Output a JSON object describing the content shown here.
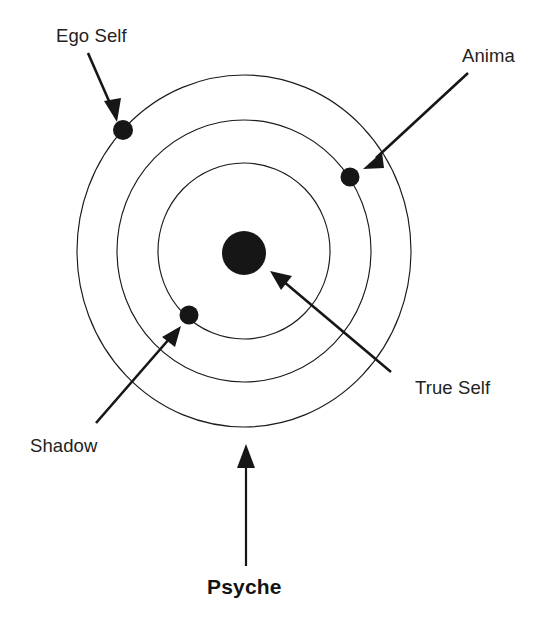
{
  "diagram": {
    "title": "Psyche",
    "type": "concentric-circles",
    "background_color": "#ffffff",
    "line_color": "#161616",
    "ring_color": "#1b1b1b",
    "center": {
      "x": 244,
      "y": 251
    },
    "rings": [
      {
        "name": "inner-ring",
        "radius_x": 86,
        "radius_y": 88
      },
      {
        "name": "middle-ring",
        "radius_x": 127,
        "radius_y": 131
      },
      {
        "name": "outer-ring",
        "radius_x": 167,
        "radius_y": 176
      }
    ],
    "nodes": [
      {
        "id": "true-self",
        "label": "True Self",
        "x": 244,
        "y": 253,
        "radius": 22,
        "ring": "center",
        "label_x": 415,
        "label_y": 379
      },
      {
        "id": "ego-self",
        "label": "Ego Self",
        "x": 123,
        "y": 130,
        "radius": 10,
        "ring": "outer-ring",
        "label_x": 56,
        "label_y": 27
      },
      {
        "id": "anima",
        "label": "Anima",
        "x": 350,
        "y": 177,
        "radius": 9.5,
        "ring": "middle-ring",
        "label_x": 462,
        "label_y": 47
      },
      {
        "id": "shadow",
        "label": "Shadow",
        "x": 189,
        "y": 315,
        "radius": 9.5,
        "ring": "inner-ring",
        "label_x": 30,
        "label_y": 437
      }
    ],
    "caption": {
      "text": "Psyche",
      "bold": true,
      "x": 207,
      "y": 576
    },
    "arrows": [
      {
        "id": "arrow-ego-self",
        "from_label": "Ego Self",
        "to_node": "ego-self",
        "direction": "down-right"
      },
      {
        "id": "arrow-anima",
        "from_label": "Anima",
        "to_node": "anima",
        "direction": "down-left"
      },
      {
        "id": "arrow-true-self",
        "from_label": "True Self",
        "to_node": "true-self",
        "direction": "up-left"
      },
      {
        "id": "arrow-shadow",
        "from_label": "Shadow",
        "to_node": "shadow",
        "direction": "up-right"
      },
      {
        "id": "arrow-psyche",
        "from_label": "Psyche",
        "to_node": "outer-ring",
        "direction": "up"
      }
    ]
  }
}
